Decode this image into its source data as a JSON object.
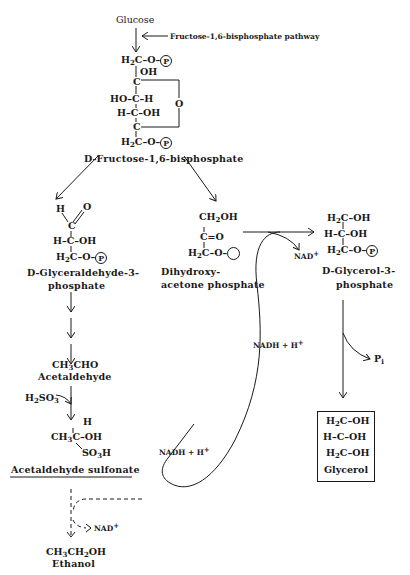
{
  "diagram": {
    "type": "metabolic-pathway",
    "start": "Glucose",
    "pathway_note": "Fructose-1,6-bisphosphate pathway",
    "fructose": {
      "line1": [
        "H",
        "2",
        "C–O–",
        "P"
      ],
      "oh_top": "OH",
      "c1": "C",
      "row_ho_c_h": "HO–C–H",
      "row_h_c_oh": "H–C–OH",
      "ring_o": "O",
      "c5": "C",
      "line_last": [
        "H",
        "2",
        "C–O–",
        "P"
      ],
      "name_prefix": "D",
      "name": "-Fructose-1,6-bisphosphate"
    },
    "gap": {
      "h": "H",
      "o": "O",
      "c": "C",
      "row2": "H–C–OH",
      "row3": [
        "H",
        "2",
        "C–O–",
        "P"
      ],
      "name_prefix": "D",
      "name_line1": "-Glyceraldehyde-3-",
      "name_line2": "phosphate"
    },
    "dhap": {
      "row1": [
        "CH",
        "2",
        "OH"
      ],
      "row2": "C=O",
      "row3": [
        "H",
        "2",
        "C–O–"
      ],
      "name_line1": "Dihydroxy-",
      "name_line2": "acetone phosphate"
    },
    "g3p": {
      "row1": [
        "H",
        "2",
        "C–OH"
      ],
      "row2": "H–C–OH",
      "row3": [
        "H",
        "2",
        "C–O–",
        "P"
      ],
      "name_prefix": "D",
      "name_line1": "-Glycerol-3-",
      "name_line2": "phosphate",
      "nad_out": [
        "NAD",
        "+"
      ]
    },
    "pi": [
      "P",
      "i"
    ],
    "glycerol": {
      "row1": [
        "H",
        "2",
        "C–OH"
      ],
      "row2": "H–C–OH",
      "row3": [
        "H",
        "2",
        "C–OH"
      ],
      "name": "Glycerol"
    },
    "acetaldehyde": {
      "formula": [
        "CH",
        "3",
        "CHO"
      ],
      "name": "Acetaldehyde"
    },
    "h2so3": [
      "H",
      "2",
      "SO",
      "3"
    ],
    "sulfonate": {
      "h": "H",
      "row": [
        "CH",
        "3",
        "C–OH"
      ],
      "so3h": [
        "SO",
        "3",
        "H"
      ],
      "name": "Acetaldehyde sulfonate"
    },
    "nadh_upper": [
      "NADH + H",
      "+"
    ],
    "nadh_lower": [
      "NADH + H",
      "+"
    ],
    "nad_ethanol": [
      "NAD",
      "+"
    ],
    "ethanol": {
      "formula": [
        "CH",
        "3",
        "CH",
        "2",
        "OH"
      ],
      "name": "Ethanol"
    }
  }
}
